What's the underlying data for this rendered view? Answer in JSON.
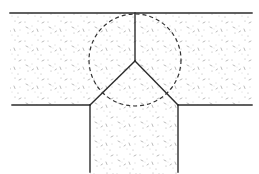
{
  "diagram": {
    "colors": {
      "background": "#ffffff",
      "line": "#2b2b2b",
      "speckle": "#9a9a9a",
      "dashed_circle": "#333333"
    },
    "members": [
      {
        "name": "top-left beam",
        "region": "upper horizontal member, left half"
      },
      {
        "name": "top-right beam",
        "region": "upper horizontal member, right half"
      },
      {
        "name": "lower stem",
        "region": "vertical member below junction"
      }
    ],
    "joint": {
      "x": 135,
      "y": 61
    },
    "circle": {
      "cx": 135,
      "cy": 60,
      "r": 46,
      "style": "dashed"
    },
    "labels": []
  }
}
